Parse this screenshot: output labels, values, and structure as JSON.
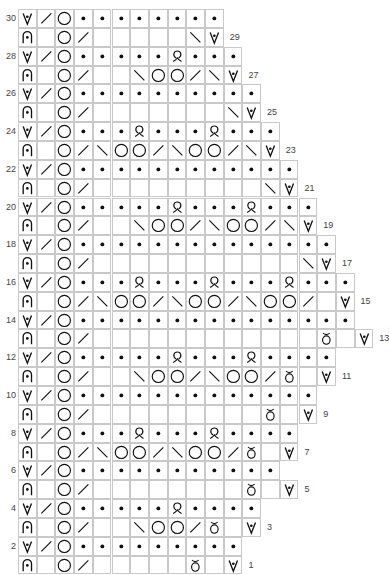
{
  "chart_title": "",
  "legend_codes": {
    "V": "slip-stitch-v-with-dot",
    "A": "arch-with-dot",
    "/": "right-slant-decrease",
    "\\": "left-slant-decrease",
    "O": "yarn-over",
    ".": "purl-dot",
    "Q": "twisted-loop",
    "B": "bobble-loop",
    "_": "knit-blank"
  },
  "colors": {
    "grid": "#c9c9c9",
    "symbol": "#111111",
    "label": "#444444"
  },
  "rows": [
    {
      "n": 30,
      "side": "left",
      "cells": "V/O........"
    },
    {
      "n": 29,
      "side": "right",
      "cells": "A_O/_____\\V"
    },
    {
      "n": 28,
      "side": "left",
      "cells": "V/O.....Q..."
    },
    {
      "n": 27,
      "side": "right",
      "cells": "A_O/__\\OO/\\V"
    },
    {
      "n": 26,
      "side": "left",
      "cells": "V/O.........."
    },
    {
      "n": 25,
      "side": "right",
      "cells": "A_O/_______\\V"
    },
    {
      "n": 24,
      "side": "left",
      "cells": "V/O...Q...Q..."
    },
    {
      "n": 23,
      "side": "right",
      "cells": "A_O/\\OO/\\OO/\\V"
    },
    {
      "n": 22,
      "side": "left",
      "cells": "V/O............"
    },
    {
      "n": 21,
      "side": "right",
      "cells": "A_O/_________\\V"
    },
    {
      "n": 20,
      "side": "left",
      "cells": "V/O.....Q...Q..."
    },
    {
      "n": 19,
      "side": "right",
      "cells": "A_O/__\\OO/\\OO/\\V"
    },
    {
      "n": 18,
      "side": "left",
      "cells": "V/O.............."
    },
    {
      "n": 17,
      "side": "right",
      "cells": "A_O/___________\\V"
    },
    {
      "n": 16,
      "side": "left",
      "cells": "V/O...Q...Q...Q..."
    },
    {
      "n": 15,
      "side": "right",
      "cells": "A_O/\\OO/\\OO/\\OO/_V"
    },
    {
      "n": 14,
      "side": "left",
      "cells": "V/O..............."
    },
    {
      "n": 13,
      "side": "right",
      "cells": "A_O/____________B_V"
    },
    {
      "n": 12,
      "side": "left",
      "cells": "V/O.....Q...Q...."
    },
    {
      "n": 11,
      "side": "right",
      "cells": "A_O/__\\OO/\\OO/B_V"
    },
    {
      "n": 10,
      "side": "left",
      "cells": "V/O............."
    },
    {
      "n": 9,
      "side": "right",
      "cells": "A_O/_________B_V"
    },
    {
      "n": 8,
      "side": "left",
      "cells": "V/O...Q...Q...."
    },
    {
      "n": 7,
      "side": "right",
      "cells": "A_O/\\OO/\\OO/B_V"
    },
    {
      "n": 6,
      "side": "left",
      "cells": "V/O..........."
    },
    {
      "n": 5,
      "side": "right",
      "cells": "A_O/________B_V"
    },
    {
      "n": 4,
      "side": "left",
      "cells": "V/O.....Q...."
    },
    {
      "n": 3,
      "side": "right",
      "cells": "A_O/__\\OO/B_V"
    },
    {
      "n": 2,
      "side": "left",
      "cells": "V/O........."
    },
    {
      "n": 1,
      "side": "right",
      "cells": "A_O/_____B_V"
    }
  ]
}
